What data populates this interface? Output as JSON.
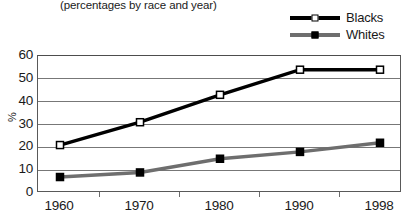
{
  "subtitle": "(percentages by race and year)",
  "legend": {
    "position": "top-right",
    "items": [
      {
        "label": "Blacks",
        "marker": "hollow-square",
        "color": "#000000"
      },
      {
        "label": "Whites",
        "marker": "filled-square",
        "color": "#6e6e6e"
      }
    ]
  },
  "axes": {
    "ylabel": "%",
    "ytick_labels": [
      "60",
      "50",
      "40",
      "30",
      "20",
      "10",
      "0"
    ],
    "xtick_labels": [
      "1960",
      "1970",
      "1980",
      "1990",
      "1998"
    ]
  },
  "chart_data": {
    "type": "line",
    "title": "",
    "subtitle": "(percentages by race and year)",
    "xlabel": "",
    "ylabel": "%",
    "categories": [
      "1960",
      "1970",
      "1980",
      "1990",
      "1998"
    ],
    "series": [
      {
        "name": "Blacks",
        "values": [
          21,
          31,
          43,
          54,
          54
        ],
        "color": "#000000",
        "marker": "hollow-square"
      },
      {
        "name": "Whites",
        "values": [
          7,
          9,
          15,
          18,
          22
        ],
        "color": "#6e6e6e",
        "marker": "filled-square"
      }
    ],
    "ylim": [
      0,
      60
    ],
    "ytick_step": 10,
    "grid": true,
    "legend_position": "top-right"
  }
}
